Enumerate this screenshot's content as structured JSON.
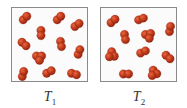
{
  "figure": {
    "atom_color": "#c0391b",
    "atom_highlight": "#e8673f",
    "atom_shadow": "#8e2410",
    "panels": [
      {
        "id": "T1",
        "label_main": "T",
        "label_sub": "1",
        "molecules": [
          {
            "x": 13,
            "y": 10,
            "angle": -45,
            "atoms": 2
          },
          {
            "x": 47,
            "y": 10,
            "angle": -45,
            "atoms": 2
          },
          {
            "x": 65,
            "y": 17,
            "angle": -35,
            "atoms": 2
          },
          {
            "x": 29,
            "y": 25,
            "angle": 90,
            "atoms": 2
          },
          {
            "x": 12,
            "y": 36,
            "angle": 40,
            "atoms": 2
          },
          {
            "x": 49,
            "y": 36,
            "angle": 80,
            "atoms": 2
          },
          {
            "x": 67,
            "y": 44,
            "angle": -70,
            "atoms": 2
          },
          {
            "x": 27,
            "y": 48,
            "angle": 0,
            "atoms": 3
          },
          {
            "x": 11,
            "y": 66,
            "angle": -75,
            "atoms": 2
          },
          {
            "x": 37,
            "y": 64,
            "angle": -30,
            "atoms": 2
          },
          {
            "x": 62,
            "y": 66,
            "angle": 15,
            "atoms": 2
          }
        ]
      },
      {
        "id": "T2",
        "label_main": "T",
        "label_sub": "2",
        "molecules": [
          {
            "x": 12,
            "y": 13,
            "angle": -40,
            "atoms": 2
          },
          {
            "x": 40,
            "y": 11,
            "angle": -20,
            "atoms": 2
          },
          {
            "x": 69,
            "y": 21,
            "angle": -80,
            "atoms": 2
          },
          {
            "x": 24,
            "y": 29,
            "angle": 80,
            "atoms": 2
          },
          {
            "x": 47,
            "y": 26,
            "angle": -10,
            "atoms": 3
          },
          {
            "x": 12,
            "y": 46,
            "angle": 60,
            "atoms": 3
          },
          {
            "x": 42,
            "y": 44,
            "angle": -25,
            "atoms": 2
          },
          {
            "x": 67,
            "y": 49,
            "angle": 40,
            "atoms": 2
          },
          {
            "x": 25,
            "y": 66,
            "angle": 0,
            "atoms": 2
          },
          {
            "x": 54,
            "y": 64,
            "angle": 45,
            "atoms": 3
          }
        ]
      }
    ]
  }
}
